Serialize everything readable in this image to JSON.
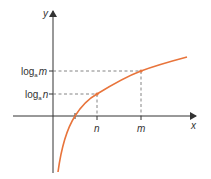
{
  "diagram": {
    "type": "logarithm-graph",
    "axes": {
      "x_label": "x",
      "y_label": "y"
    },
    "x_ticks": [
      {
        "label": "n"
      },
      {
        "label": "m"
      }
    ],
    "y_ticks": [
      {
        "prefix": "log",
        "base": "a",
        "arg": "m"
      },
      {
        "prefix": "log",
        "base": "a",
        "arg": "n"
      }
    ],
    "curve": {
      "function": "y = log_a x",
      "color": "#e8743b"
    },
    "colors": {
      "axis": "#333333",
      "guide": "#555555",
      "curve": "#e8743b"
    }
  }
}
